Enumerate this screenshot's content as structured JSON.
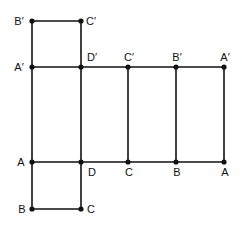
{
  "figure": {
    "colors": {
      "line": "#111111",
      "background": "#ffffff"
    }
  },
  "vertices": [
    {
      "id": "top_B1",
      "label": "B′",
      "x": 32,
      "y": 21,
      "lx": 19,
      "ly": 25,
      "anchor": "middle"
    },
    {
      "id": "top_C1",
      "label": "C′",
      "x": 81,
      "y": 21,
      "lx": 91,
      "ly": 25,
      "anchor": "middle"
    },
    {
      "id": "mid_A1",
      "label": "A′",
      "x": 32,
      "y": 67,
      "lx": 19,
      "ly": 71,
      "anchor": "middle"
    },
    {
      "id": "mid_D1",
      "label": "D′",
      "x": 81,
      "y": 67,
      "lx": 92,
      "ly": 61,
      "anchor": "middle"
    },
    {
      "id": "mid_C1",
      "label": "C′",
      "x": 128,
      "y": 67,
      "lx": 129,
      "ly": 61,
      "anchor": "middle"
    },
    {
      "id": "mid_B1",
      "label": "B′",
      "x": 176,
      "y": 67,
      "lx": 177,
      "ly": 61,
      "anchor": "middle"
    },
    {
      "id": "mid_A1r",
      "label": "A′",
      "x": 224,
      "y": 67,
      "lx": 225,
      "ly": 61,
      "anchor": "middle"
    },
    {
      "id": "bot_A",
      "label": "A",
      "x": 32,
      "y": 162,
      "lx": 21,
      "ly": 166,
      "anchor": "middle"
    },
    {
      "id": "bot_D",
      "label": "D",
      "x": 81,
      "y": 162,
      "lx": 92,
      "ly": 176,
      "anchor": "middle"
    },
    {
      "id": "bot_C",
      "label": "C",
      "x": 128,
      "y": 162,
      "lx": 129,
      "ly": 176,
      "anchor": "middle"
    },
    {
      "id": "bot_B",
      "label": "B",
      "x": 176,
      "y": 162,
      "lx": 177,
      "ly": 176,
      "anchor": "middle"
    },
    {
      "id": "bot_Ar",
      "label": "A",
      "x": 224,
      "y": 162,
      "lx": 225,
      "ly": 176,
      "anchor": "middle"
    },
    {
      "id": "low_B",
      "label": "B",
      "x": 32,
      "y": 209,
      "lx": 22,
      "ly": 213,
      "anchor": "middle"
    },
    {
      "id": "low_C",
      "label": "C",
      "x": 81,
      "y": 209,
      "lx": 91,
      "ly": 213,
      "anchor": "middle"
    }
  ],
  "edges": [
    {
      "x1": 32,
      "y1": 21,
      "x2": 81,
      "y2": 21
    },
    {
      "x1": 32,
      "y1": 21,
      "x2": 32,
      "y2": 209
    },
    {
      "x1": 81,
      "y1": 21,
      "x2": 81,
      "y2": 209
    },
    {
      "x1": 32,
      "y1": 67,
      "x2": 224,
      "y2": 67
    },
    {
      "x1": 32,
      "y1": 162,
      "x2": 224,
      "y2": 162
    },
    {
      "x1": 128,
      "y1": 67,
      "x2": 128,
      "y2": 162
    },
    {
      "x1": 176,
      "y1": 67,
      "x2": 176,
      "y2": 162
    },
    {
      "x1": 224,
      "y1": 67,
      "x2": 224,
      "y2": 162
    },
    {
      "x1": 32,
      "y1": 209,
      "x2": 81,
      "y2": 209
    }
  ]
}
